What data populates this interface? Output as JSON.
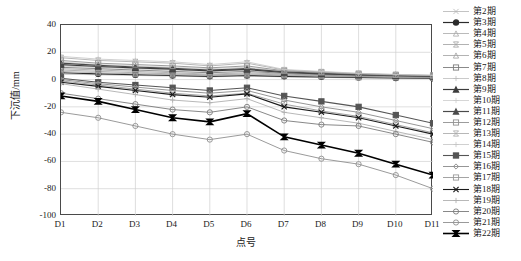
{
  "chart_data": {
    "type": "line",
    "title": "",
    "xlabel": "点号",
    "ylabel": "下沉值/mm",
    "categories": [
      "D1",
      "D2",
      "D3",
      "D4",
      "D5",
      "D6",
      "D7",
      "D8",
      "D9",
      "D10",
      "D11"
    ],
    "xticklabels": [
      "D1",
      "D2",
      "D3",
      "D4",
      "D5",
      "D6",
      "D7",
      "D8",
      "D9",
      "D10",
      "D11"
    ],
    "yticklabels": [
      "40",
      "20",
      "0",
      "-20",
      "-40",
      "-60",
      "-80",
      "-100"
    ],
    "ytickvalues": [
      40,
      20,
      0,
      -20,
      -40,
      -60,
      -80,
      -100
    ],
    "ylim": [
      -100,
      40
    ],
    "grid": true,
    "legend_position": "right",
    "series": [
      {
        "name": "第2期",
        "marker": "x",
        "color": "#b4b4b4",
        "width": 0.8,
        "values": [
          4.0,
          3.5,
          3.0,
          2.6,
          2.0,
          2.6,
          2.0,
          1.6,
          1.2,
          1.0,
          0.8
        ]
      },
      {
        "name": "第3期",
        "marker": "circle-f",
        "color": "#2b2b2b",
        "width": 1.2,
        "values": [
          5.0,
          4.2,
          3.6,
          3.0,
          2.4,
          3.0,
          2.4,
          2.0,
          1.6,
          1.2,
          1.0
        ]
      },
      {
        "name": "第4期",
        "marker": "triangle",
        "color": "#a8a8a8",
        "width": 0.8,
        "values": [
          6.0,
          5.0,
          4.2,
          3.6,
          3.0,
          3.6,
          3.0,
          2.4,
          2.0,
          1.6,
          1.4
        ]
      },
      {
        "name": "第5期",
        "marker": "bowtie",
        "color": "#9e9e9e",
        "width": 0.8,
        "values": [
          7.0,
          6.0,
          5.0,
          4.2,
          3.4,
          4.2,
          3.4,
          2.8,
          2.2,
          1.8,
          1.6
        ]
      },
      {
        "name": "第6期",
        "marker": "triangle",
        "color": "#a0a0a0",
        "width": 0.8,
        "values": [
          8.0,
          7.0,
          6.0,
          5.0,
          4.0,
          5.0,
          4.0,
          3.2,
          2.6,
          2.2,
          1.8
        ]
      },
      {
        "name": "第7期",
        "marker": "square",
        "color": "#7d7d7d",
        "width": 0.9,
        "values": [
          9.0,
          8.0,
          7.0,
          6.0,
          5.0,
          6.0,
          4.6,
          3.6,
          3.0,
          2.4,
          2.0
        ]
      },
      {
        "name": "第8期",
        "marker": "plus",
        "color": "#bdbdbd",
        "width": 0.8,
        "values": [
          10.0,
          9.0,
          8.0,
          7.0,
          6.0,
          7.0,
          5.0,
          4.0,
          3.2,
          2.6,
          2.2
        ]
      },
      {
        "name": "第9期",
        "marker": "triangle-f",
        "color": "#3c3c3c",
        "width": 1.2,
        "values": [
          11.0,
          9.6,
          8.6,
          7.6,
          6.4,
          7.4,
          5.2,
          4.2,
          3.4,
          2.8,
          2.4
        ]
      },
      {
        "name": "第10期",
        "marker": "plus",
        "color": "#cccccc",
        "width": 0.8,
        "values": [
          13.0,
          11.0,
          10.0,
          9.0,
          8.0,
          9.0,
          6.0,
          5.0,
          4.0,
          3.2,
          2.8
        ]
      },
      {
        "name": "第11期",
        "marker": "triangle-f",
        "color": "#4a4a4a",
        "width": 1.2,
        "values": [
          12.0,
          10.4,
          9.2,
          8.2,
          7.0,
          8.0,
          5.6,
          4.6,
          3.6,
          3.0,
          2.6
        ]
      },
      {
        "name": "第12期",
        "marker": "square",
        "color": "#919191",
        "width": 0.9,
        "values": [
          14.0,
          12.0,
          11.0,
          10.0,
          8.6,
          10.0,
          6.4,
          5.2,
          4.2,
          3.4,
          3.0
        ]
      },
      {
        "name": "第13期",
        "marker": "bowtie",
        "color": "#a5a5a5",
        "width": 0.8,
        "values": [
          16.0,
          14.0,
          13.0,
          12.0,
          10.0,
          12.0,
          7.0,
          5.6,
          4.4,
          3.6,
          3.0
        ]
      },
      {
        "name": "第14期",
        "marker": "plus",
        "color": "#c4c4c4",
        "width": 0.8,
        "values": [
          17.0,
          15.0,
          14.0,
          13.0,
          11.0,
          13.0,
          7.4,
          6.0,
          4.6,
          3.8,
          3.2
        ]
      },
      {
        "name": "第15期",
        "marker": "square-f",
        "color": "#555555",
        "width": 1.1,
        "values": [
          1.0,
          -2.0,
          -4.0,
          -6.0,
          -8.0,
          -6.0,
          -12.0,
          -16.0,
          -20.0,
          -26.0,
          -32.0
        ]
      },
      {
        "name": "第16期",
        "marker": "diamond",
        "color": "#8a8a8a",
        "width": 0.9,
        "values": [
          0.0,
          -3.0,
          -5.5,
          -8.0,
          -10.0,
          -8.0,
          -15.0,
          -20.0,
          -24.0,
          -30.0,
          -36.0
        ]
      },
      {
        "name": "第17期",
        "marker": "square",
        "color": "#9a9a9a",
        "width": 0.9,
        "values": [
          -1.0,
          -4.0,
          -7.0,
          -10.0,
          -12.0,
          -10.0,
          -18.0,
          -23.0,
          -27.0,
          -33.0,
          -39.0
        ]
      },
      {
        "name": "第18期",
        "marker": "x-bold",
        "color": "#1a1a1a",
        "width": 1.1,
        "values": [
          -2.0,
          -5.0,
          -8.0,
          -11.0,
          -13.0,
          -10.5,
          -20.0,
          -24.0,
          -28.0,
          -34.0,
          -40.0
        ]
      },
      {
        "name": "第19期",
        "marker": "plus",
        "color": "#b0b0b0",
        "width": 0.9,
        "values": [
          -3.0,
          -7.0,
          -11.0,
          -15.0,
          -17.0,
          -14.0,
          -24.0,
          -28.0,
          -32.0,
          -38.0,
          -44.0
        ]
      },
      {
        "name": "第20期",
        "marker": "circle",
        "color": "#7a7a7a",
        "width": 0.9,
        "values": [
          -10.0,
          -14.0,
          -18.0,
          -22.0,
          -24.0,
          -20.0,
          -30.0,
          -33.0,
          -34.0,
          -40.0,
          -46.0
        ]
      },
      {
        "name": "第21期",
        "marker": "circle",
        "color": "#8f8f8f",
        "width": 0.9,
        "values": [
          -24.0,
          -28.0,
          -34.0,
          -40.0,
          -44.0,
          -40.0,
          -52.0,
          -58.0,
          -62.0,
          -70.0,
          -80.0
        ]
      },
      {
        "name": "第22期",
        "marker": "bowtie-f",
        "color": "#000000",
        "width": 1.6,
        "values": [
          -12.0,
          -16.0,
          -22.0,
          -28.0,
          -31.0,
          -25.0,
          -42.0,
          -48.0,
          -54.0,
          -62.0,
          -70.0
        ]
      }
    ]
  }
}
